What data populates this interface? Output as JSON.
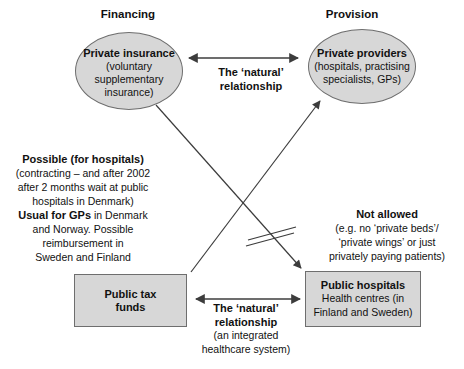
{
  "headers": {
    "financing": "Financing",
    "provision": "Provision"
  },
  "nodes": {
    "private_insurance": {
      "title": "Private insurance",
      "subtitle_lines": [
        "(voluntary",
        "supplementary",
        "insurance)"
      ]
    },
    "private_providers": {
      "title": "Private providers",
      "subtitle_lines": [
        "(hospitals, practising",
        "specialists, GPs)"
      ]
    },
    "public_tax_funds": {
      "title_lines": [
        "Public tax",
        "funds"
      ]
    },
    "public_hospitals": {
      "title": "Public hospitals",
      "subtitle_lines": [
        "Health centres (in",
        "Finland and Sweden)"
      ]
    }
  },
  "labels": {
    "top_relationship": {
      "line1": "The ‘natural’",
      "line2": "relationship"
    },
    "bottom_relationship": {
      "line1": "The ‘natural’",
      "line2": "relationship",
      "line3": "(an integrated",
      "line4": "healthcare system)"
    }
  },
  "notes": {
    "possible": {
      "heading": "Possible (for hospitals)",
      "line2": "(contracting – and after 2002",
      "line3": "after 2 months wait at public",
      "line4": "hospitals in Denmark)",
      "line5_bold": "Usual for GPs",
      "line5_rest": " in Denmark",
      "line6": "and Norway. Possible",
      "line7": "reimbursement in",
      "line8": "Sweden and Finland"
    },
    "not_allowed": {
      "heading": "Not allowed",
      "line2": "(e.g. no ‘private beds’/",
      "line3": "‘private wings’ or just",
      "line4": "privately paying patients)"
    }
  },
  "colors": {
    "node_fill": "#d7d7d7",
    "node_border": "#6e6e6e",
    "connector_line": "#3c3c3c",
    "text": "#111111",
    "background": "#ffffff"
  }
}
